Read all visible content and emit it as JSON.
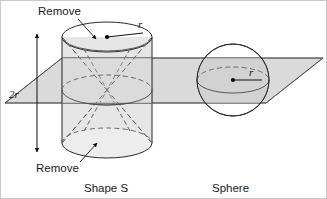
{
  "figure": {
    "title_alt": "Shape S and Sphere cut by a horizontal plane",
    "background_color": "#ffffff",
    "frame_color": "#c9c9c9"
  },
  "labels": {
    "remove_top": "Remove",
    "remove_bottom": "Remove",
    "height_dimension": "2r",
    "cylinder_radius": "r",
    "sphere_radius": "r",
    "caption_left": "Shape S",
    "caption_right": "Sphere"
  },
  "colors": {
    "plane_fill": "#d2d2d2",
    "solid_fill": "#e2e2e2",
    "solid_fill_light": "#eaeaea",
    "outline": "#2b2b2b",
    "hidden_edge": "#6d6d6d",
    "text": "#1a1a1a"
  },
  "geometry": {
    "cylinder": {
      "center_x": 107,
      "top_ellipse_cy": 37,
      "bottom_ellipse_cy": 143,
      "rx": 45,
      "ry": 15,
      "height_px": 106
    },
    "sphere": {
      "center_x": 233,
      "center_y": 80,
      "radius": 36,
      "equator_rx": 36,
      "equator_ry": 13
    },
    "plane": {
      "top_left_x": 62,
      "top_y": 58,
      "bottom_left_x": 5,
      "bottom_y": 103,
      "right_tip_x": 323
    },
    "dimension_arrow": {
      "x": 37,
      "y_top": 30,
      "y_bottom": 156
    }
  },
  "annotations": [
    {
      "name": "remove-top-annotation",
      "text": "Remove",
      "target": "upper cone region of cylinder"
    },
    {
      "name": "remove-bottom-annotation",
      "text": "Remove",
      "target": "lower cone region of cylinder"
    },
    {
      "name": "height-dimension",
      "text": "2r",
      "meaning": "cylinder height equals twice the radius"
    },
    {
      "name": "cylinder-radius-label",
      "text": "r",
      "meaning": "radius of cylinder top face"
    },
    {
      "name": "sphere-radius-label",
      "text": "r",
      "meaning": "radius of sphere"
    }
  ]
}
